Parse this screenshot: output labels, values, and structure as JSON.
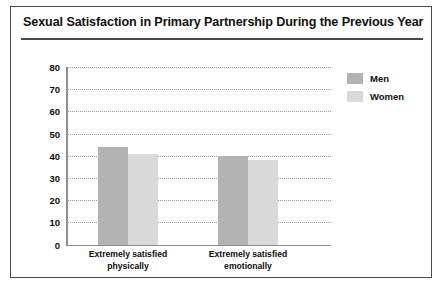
{
  "chart_data": {
    "type": "bar",
    "title": "Sexual Satisfaction in Primary Partnership During the Previous Year",
    "categories": [
      "Extremely satisfied physically",
      "Extremely satisfied emotionally"
    ],
    "category_lines": [
      [
        "Extremely satisfied",
        "physically"
      ],
      [
        "Extremely satisfied",
        "emotionally"
      ]
    ],
    "series": [
      {
        "name": "Men",
        "values": [
          44,
          40
        ],
        "color": "#b3b3b3"
      },
      {
        "name": "Women",
        "values": [
          41,
          38
        ],
        "color": "#d9d9d9"
      }
    ],
    "xlabel": "",
    "ylabel": "",
    "ylim": [
      0,
      80
    ],
    "ytick_step": 10,
    "yticks": [
      80,
      70,
      60,
      50,
      40,
      30,
      20,
      10,
      0
    ],
    "grid": true,
    "legend_position": "top-right"
  },
  "legend": {
    "items": [
      {
        "label": "Men",
        "color": "#b3b3b3"
      },
      {
        "label": "Women",
        "color": "#d9d9d9"
      }
    ]
  }
}
